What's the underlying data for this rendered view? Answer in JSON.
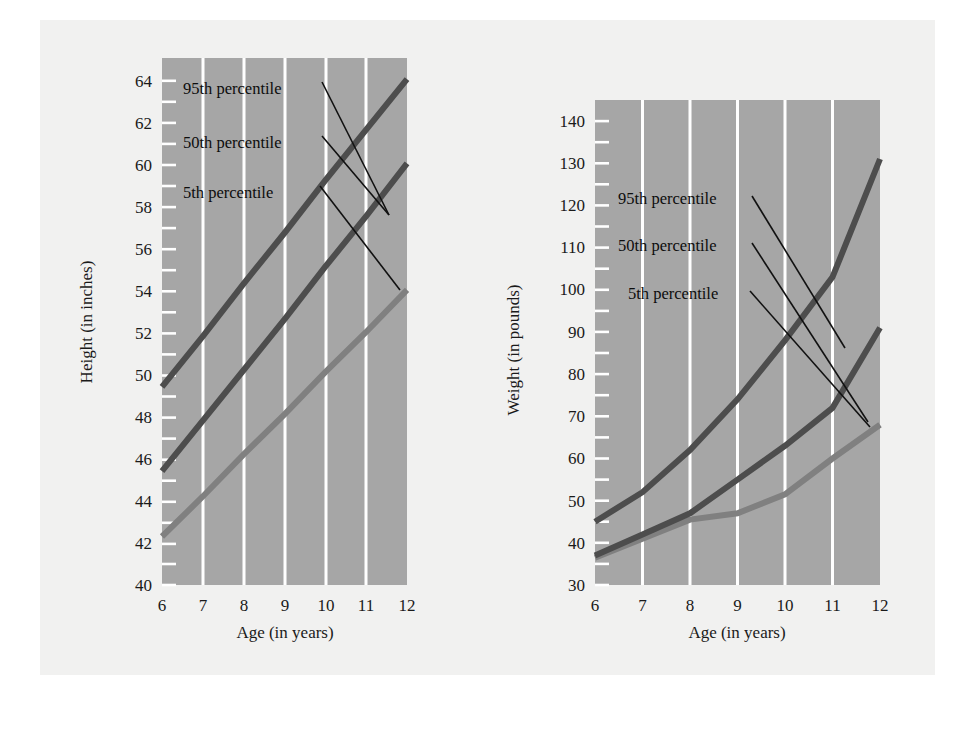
{
  "figure": {
    "background_color": "#f1f1f0",
    "plot_background_color": "#a6a6a6",
    "gridline_color": "#ffffff",
    "tick_color": "#ffffff",
    "text_color": "#1a1a1a"
  },
  "series_colors": {
    "p95": "#4d4d4d",
    "p50": "#4d4d4d",
    "p5": "#808080",
    "leader_line": "#111111"
  },
  "annotations": {
    "p95_label": "95th percentile",
    "p50_label": "50th percentile",
    "p5_label": "5th percentile"
  },
  "chart_data": [
    {
      "id": "height-chart",
      "type": "line",
      "title": "",
      "xlabel": "Age (in years)",
      "ylabel": "Height (in inches)",
      "xlim": [
        6,
        12
      ],
      "ylim": [
        40,
        65
      ],
      "x": [
        6,
        7,
        8,
        9,
        10,
        11,
        12
      ],
      "xtick_labels": [
        "6",
        "7",
        "8",
        "9",
        "10",
        "11",
        "12"
      ],
      "ytick_labels": [
        "40",
        "42",
        "44",
        "46",
        "48",
        "50",
        "52",
        "54",
        "56",
        "58",
        "60",
        "62",
        "64"
      ],
      "ytick_values": [
        40,
        42,
        44,
        46,
        48,
        50,
        52,
        54,
        56,
        58,
        60,
        62,
        64
      ],
      "yminor_step": 1,
      "grid": "vertical",
      "legend_position": "inline-annotations",
      "series": [
        {
          "name": "95th percentile",
          "values": [
            49.4,
            51.8,
            54.3,
            56.7,
            59.2,
            61.6,
            64.0
          ]
        },
        {
          "name": "50th percentile",
          "values": [
            45.4,
            47.8,
            50.2,
            52.6,
            55.1,
            57.5,
            60.0
          ]
        },
        {
          "name": "5th percentile",
          "values": [
            42.3,
            44.2,
            46.2,
            48.1,
            50.1,
            52.0,
            54.0
          ]
        }
      ]
    },
    {
      "id": "weight-chart",
      "type": "line",
      "title": "",
      "xlabel": "Age (in years)",
      "ylabel": "Weight (in pounds)",
      "xlim": [
        6,
        12
      ],
      "ylim": [
        30,
        145
      ],
      "x": [
        6,
        7,
        8,
        9,
        10,
        11,
        12
      ],
      "xtick_labels": [
        "6",
        "7",
        "8",
        "9",
        "10",
        "11",
        "12"
      ],
      "ytick_labels": [
        "30",
        "40",
        "50",
        "60",
        "70",
        "80",
        "90",
        "100",
        "110",
        "120",
        "130",
        "140"
      ],
      "ytick_values": [
        30,
        40,
        50,
        60,
        70,
        80,
        90,
        100,
        110,
        120,
        130,
        140
      ],
      "yminor_step": 5,
      "grid": "vertical",
      "legend_position": "inline-annotations",
      "series": [
        {
          "name": "95th percentile",
          "values": [
            45,
            52,
            62,
            74,
            88,
            103,
            131
          ]
        },
        {
          "name": "50th percentile",
          "values": [
            37,
            42,
            47,
            55,
            63,
            72,
            91
          ]
        },
        {
          "name": "5th percentile",
          "values": [
            36.5,
            41,
            45.5,
            47,
            51.5,
            60,
            68
          ]
        }
      ]
    }
  ]
}
